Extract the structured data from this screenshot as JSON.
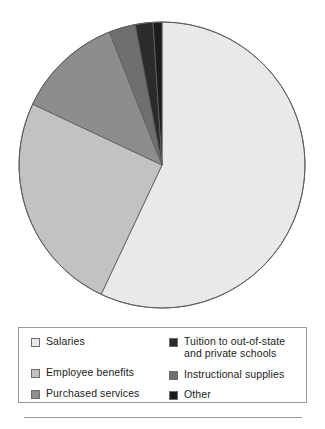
{
  "figure": {
    "title": "",
    "background": "#ffffff"
  },
  "chart_data": {
    "type": "pie",
    "title": "",
    "subtitle": "",
    "xlabel": "",
    "ylabel": "",
    "grid": false,
    "legend_position": "bottom",
    "start_angle_deg": 0,
    "direction": "clockwise",
    "center": {
      "x": 162,
      "y": 165
    },
    "radius": 143,
    "labels": [
      "Salaries",
      "Tuition to out-of-state and private schools",
      "Instructional supplies",
      "Other",
      "Purchased services",
      "Employee benefits"
    ],
    "slices": [
      {
        "label": "Salaries",
        "value": 57.0,
        "color": "#e9e9e9",
        "start_deg": 0.0,
        "end_deg": 205.2
      },
      {
        "label": "Employee benefits",
        "value": 25.0,
        "color": "#c2c2c2",
        "start_deg": 205.2,
        "end_deg": 295.2
      },
      {
        "label": "Purchased services",
        "value": 12.0,
        "color": "#8d8d8d",
        "start_deg": 295.2,
        "end_deg": 338.4
      },
      {
        "label": "Instructional supplies",
        "value": 3.0,
        "color": "#6f6f6f",
        "start_deg": 338.4,
        "end_deg": 349.2
      },
      {
        "label": "Tuition to out-of-state and private schools",
        "value": 2.0,
        "color": "#2b2b2b",
        "start_deg": 349.2,
        "end_deg": 356.4
      },
      {
        "label": "Other",
        "value": 1.0,
        "color": "#1c1c1c",
        "start_deg": 356.4,
        "end_deg": 360.0
      }
    ],
    "values": [
      57.0,
      25.0,
      12.0,
      3.0,
      2.0,
      1.0
    ],
    "categories": [
      "Salaries",
      "Employee benefits",
      "Purchased services",
      "Instructional supplies",
      "Tuition to out-of-state and private schools",
      "Other"
    ],
    "units": "percent",
    "outline_color": "#5f5f5f"
  },
  "legend": {
    "border_color": "#9a9a9a",
    "left_column": [
      {
        "label": "Salaries",
        "color": "#e9e9e9"
      },
      {
        "label": "Employee benefits",
        "color": "#c2c2c2"
      },
      {
        "label": "Purchased services",
        "color": "#8d8d8d"
      }
    ],
    "right_column": [
      {
        "label": "Tuition to out-of-state\nand private schools",
        "color": "#2b2b2b"
      },
      {
        "label": "Instructional supplies",
        "color": "#6f6f6f"
      },
      {
        "label": "Other",
        "color": "#1c1c1c"
      }
    ]
  }
}
